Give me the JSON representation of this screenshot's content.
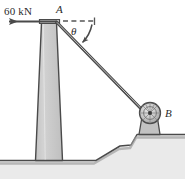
{
  "figure": {
    "type": "free-body-diagram",
    "background_color": "#ffffff",
    "outline_color": "#3a3a3a",
    "fill_gray": "#c9c9c9",
    "ground_gray": "#bdbdbd"
  },
  "labels": {
    "force": "60 kN",
    "point_a": "A",
    "point_b": "B",
    "angle": "θ"
  },
  "annotations": {
    "force_arrow": {
      "name": "horizontal force arrow",
      "direction": "left",
      "magnitude": "60 kN",
      "applied_at": "A"
    },
    "reference_line": {
      "name": "horizontal dashed reference",
      "style": "dashed"
    },
    "angle_arc": {
      "name": "angle between cable and horizontal",
      "symbol": "θ"
    },
    "cable": {
      "name": "cable from A to B",
      "from": "A",
      "to": "B"
    },
    "pulley": {
      "name": "pulley at B",
      "shape": "circle with radial hatching"
    }
  }
}
